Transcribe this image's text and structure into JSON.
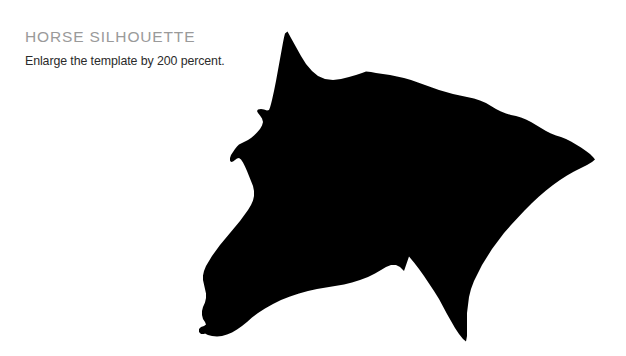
{
  "page": {
    "background_color": "#ffffff",
    "width": 626,
    "height": 356
  },
  "header": {
    "title": "HORSE SILHOUETTE",
    "title_color": "#9a9a9a",
    "subtitle": "Enlarge the template by 200 percent.",
    "subtitle_color": "#2b2b2b"
  },
  "artwork": {
    "name": "horse-head-silhouette",
    "fill_color": "#000000",
    "description": "Solid black silhouette of a horse head in right profile with pointed ear, forelock, muzzle and flowing mane"
  }
}
